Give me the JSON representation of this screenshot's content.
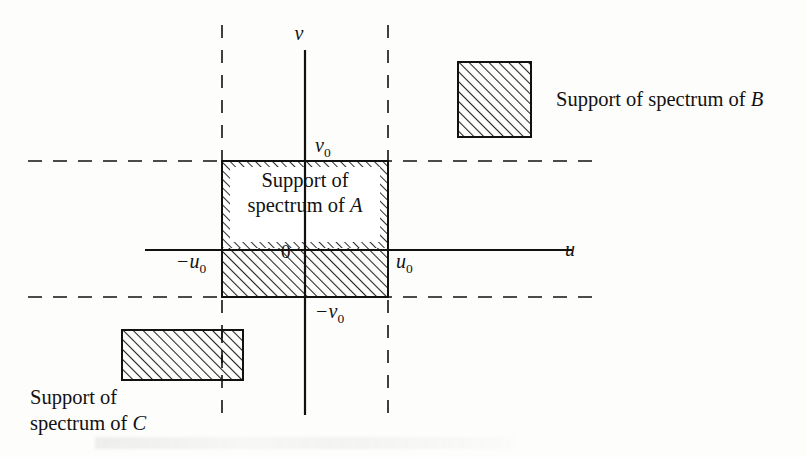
{
  "figure": {
    "caption_present": false,
    "background_color": "#fdfdfc",
    "ink_color": "#111111"
  },
  "axes": {
    "horizontal": {
      "name": "u-axis",
      "label": "u",
      "label_x": 565,
      "label_y": 256,
      "x1": 145,
      "x2": 572,
      "y": 250
    },
    "vertical": {
      "name": "v-axis",
      "label": "v",
      "label_x": 299,
      "label_y": 40,
      "x": 305,
      "y1": 50,
      "y2": 415
    },
    "origin_label": "0",
    "origin_label_x": 281,
    "origin_label_y": 258
  },
  "tick_labels": {
    "u_positive": {
      "base": "u",
      "sub": "0",
      "x": 396,
      "y": 268
    },
    "u_negative": {
      "base": "−u",
      "sub": "0",
      "x": 176,
      "y": 268
    },
    "v_positive": {
      "base": "v",
      "sub": "0",
      "x": 315,
      "y": 152
    },
    "v_negative": {
      "base": "−v",
      "sub": "0",
      "x": 315,
      "y": 318
    }
  },
  "dashed_lines": {
    "horizontal": [
      {
        "name": "dashed-line-v0",
        "y": 161,
        "x1": 28,
        "x2": 600
      },
      {
        "name": "dashed-line-minus-v0",
        "y": 297,
        "x1": 28,
        "x2": 600
      }
    ],
    "vertical": [
      {
        "name": "dashed-line-minus-u0",
        "x": 222,
        "y1": 25,
        "y2": 415
      },
      {
        "name": "dashed-line-u0",
        "x": 388,
        "y1": 25,
        "y2": 415
      }
    ]
  },
  "regions": {
    "support_a": {
      "label_line1": "Support of",
      "label_line2_prefix": "spectrum of ",
      "label_line2_symbol": "A",
      "x": 222,
      "y": 161,
      "width": 166,
      "height": 136,
      "label_band_y": 163,
      "label_band_height": 85,
      "label_x": 305,
      "label_line1_y": 187,
      "label_line2_y": 212
    },
    "support_b": {
      "legend_text_prefix": "Support of spectrum of ",
      "legend_text_symbol": "B",
      "swatch_x": 458,
      "swatch_y": 62,
      "swatch_width": 73,
      "swatch_height": 75,
      "text_x": 556,
      "text_y": 106
    },
    "support_c": {
      "legend_line1": "Support of",
      "legend_line2_prefix": "spectrum of ",
      "legend_line2_symbol": "C",
      "swatch_x": 122,
      "swatch_y": 330,
      "swatch_width": 121,
      "swatch_height": 50,
      "text_x": 30,
      "line1_y": 404,
      "line2_y": 430
    }
  },
  "hatching": {
    "angle_degrees": 45,
    "direction": "lower-left-to-upper-right",
    "spacing_px": 7,
    "stroke_color": "#222222"
  }
}
